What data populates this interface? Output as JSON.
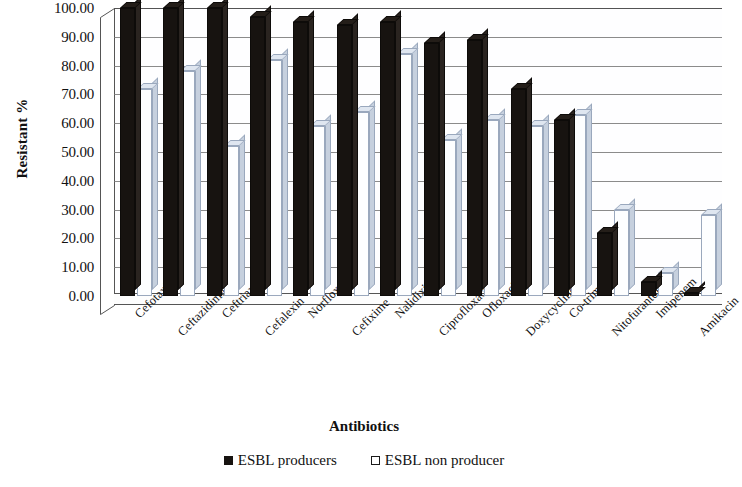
{
  "chart": {
    "ylabel": "Resistant %",
    "xlabel": "Antibiotics",
    "ytick_labels": [
      "100.00",
      "90.00",
      "80.00",
      "70.00",
      "60.00",
      "50.00",
      "40.00",
      "30.00",
      "20.00",
      "10.00",
      "0.00"
    ],
    "legend": [
      {
        "label": "ESBL producers",
        "swatch": "filled-square",
        "color": "#171310"
      },
      {
        "label": "ESBL non producer",
        "swatch": "hollow-square",
        "color": "#ffffff"
      }
    ]
  },
  "chart_data": {
    "type": "bar",
    "title": "",
    "xlabel": "Antibiotics",
    "ylabel": "Resistant %",
    "ylim": [
      0,
      100
    ],
    "ytick_values": [
      0,
      10,
      20,
      30,
      40,
      50,
      60,
      70,
      80,
      90,
      100
    ],
    "grid": true,
    "legend_position": "bottom",
    "categories": [
      "Cefotaxime",
      "Ceftazidime",
      "Ceftriaxone",
      "Cefalexin",
      "Norfloxacin",
      "Cefixime",
      "Nalidixic Acid",
      "Ciprofloxacin",
      "Ofloxacin",
      "Doxycycline",
      "Co-trimoxazole",
      "Nitofurantoin",
      "Imipenem",
      "Amikacin"
    ],
    "series": [
      {
        "name": "ESBL producers",
        "color": "#171310",
        "values": [
          100,
          100,
          100,
          97,
          95,
          94,
          95,
          88,
          89,
          72,
          61,
          22,
          5,
          1
        ]
      },
      {
        "name": "ESBL non producer",
        "color": "#ffffff",
        "values": [
          72,
          78,
          52,
          82,
          59,
          64,
          84,
          54,
          61,
          59,
          63,
          30,
          8,
          28
        ]
      }
    ]
  }
}
